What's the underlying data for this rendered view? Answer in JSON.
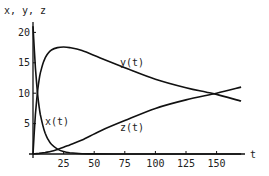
{
  "chart_data": {
    "type": "line",
    "title": "",
    "xlabel": "t",
    "ylabel": "x, y, z",
    "xlim": [
      0,
      172
    ],
    "ylim": [
      0,
      21
    ],
    "grid": false,
    "legend": "inline labels",
    "x_ticks": [
      25,
      50,
      75,
      100,
      125,
      150
    ],
    "y_ticks": [
      5,
      10,
      15,
      20
    ],
    "series": [
      {
        "name": "x(t)",
        "label": "x(t)",
        "x": [
          0,
          1,
          2,
          3,
          4,
          5,
          6,
          8,
          10,
          12,
          15,
          20,
          25,
          30,
          40,
          50,
          75,
          100,
          125,
          150,
          170
        ],
        "values": [
          21,
          17.5,
          14.2,
          11.5,
          9.4,
          7.8,
          6.5,
          4.7,
          3.4,
          2.5,
          1.6,
          0.8,
          0.4,
          0.2,
          0.05,
          0.02,
          0,
          0,
          0,
          0,
          0
        ]
      },
      {
        "name": "y(t)",
        "label": "y(t)",
        "x": [
          0,
          1,
          2,
          3,
          4,
          5,
          6,
          8,
          10,
          12,
          15,
          20,
          25,
          30,
          40,
          55,
          75,
          100,
          125,
          141,
          150,
          170
        ],
        "values": [
          0,
          3.4,
          6.5,
          8.9,
          10.8,
          12.2,
          13.3,
          14.8,
          15.8,
          16.5,
          17.1,
          17.5,
          17.6,
          17.5,
          17.0,
          15.8,
          14.2,
          12.3,
          10.9,
          10.2,
          9.8,
          8.7
        ]
      },
      {
        "name": "z(t)",
        "label": "z(t)",
        "x": [
          0,
          5,
          10,
          15,
          20,
          25,
          30,
          40,
          55,
          75,
          100,
          125,
          150,
          170
        ],
        "values": [
          0,
          0.1,
          0.25,
          0.45,
          0.75,
          1.1,
          1.5,
          2.3,
          3.8,
          5.5,
          7.5,
          8.9,
          10.0,
          11.0
        ]
      }
    ],
    "annotations": [
      {
        "text": "x(t)",
        "t": 14,
        "value": 5
      },
      {
        "text": "y(t)",
        "t": 76,
        "value": 14.8
      },
      {
        "text": "z(t)",
        "t": 76,
        "value": 4.1
      }
    ]
  },
  "labels": {
    "y_axis": "x, y, z",
    "x_axis": "t",
    "x_tick_labels": [
      "25",
      "50",
      "75",
      "100",
      "125",
      "150"
    ],
    "y_tick_labels": [
      "5",
      "10",
      "15",
      "20"
    ],
    "curve_x": "x(t)",
    "curve_y": "y(t)",
    "curve_z": "z(t)"
  }
}
